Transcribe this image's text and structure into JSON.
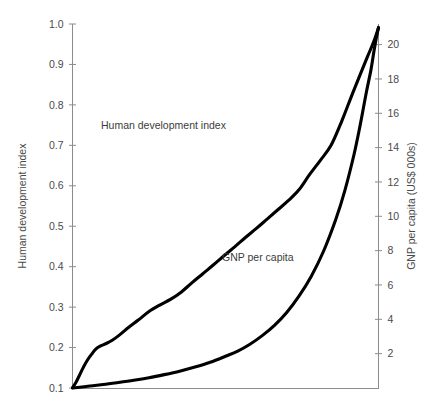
{
  "chart_data": {
    "type": "line",
    "title": "",
    "xlabel": "",
    "grid": false,
    "legend_position": "inline-annotations",
    "axes": {
      "left": {
        "label": "Human development index",
        "ticks": [
          "0.1",
          "0.2",
          "0.3",
          "0.4",
          "0.5",
          "0.6",
          "0.7",
          "0.8",
          "0.9",
          "1.0"
        ],
        "tick_values": [
          0.1,
          0.2,
          0.3,
          0.4,
          0.5,
          0.6,
          0.7,
          0.8,
          0.9,
          1.0
        ],
        "ylim": [
          0.1,
          1.0
        ]
      },
      "right": {
        "label": "GNP per capita (US$ 000s)",
        "ticks": [
          "2",
          "4",
          "6",
          "8",
          "10",
          "12",
          "14",
          "16",
          "18",
          "20"
        ],
        "tick_values": [
          2,
          4,
          6,
          8,
          10,
          12,
          14,
          16,
          18,
          20
        ],
        "ylim": [
          0,
          21.2
        ]
      },
      "x": {
        "label": "",
        "ticks": [],
        "xlim": [
          0,
          100
        ]
      }
    },
    "series": [
      {
        "name": "Human development index",
        "annotation": "Human development index",
        "axis": "left",
        "color": "#000000",
        "x": [
          0,
          1.2,
          2.5,
          3.6,
          4.8,
          6.2,
          7.6,
          9.2,
          11.0,
          13.0,
          15.5,
          18.5,
          21.5,
          25.0,
          28.5,
          32.0,
          35.5,
          39.0,
          42.5,
          46.0,
          49.5,
          53.0,
          56.5,
          60.0,
          63.5,
          67.0,
          70.5,
          74.0,
          77.5,
          81.0,
          84.5,
          88.0,
          91.5,
          94.5,
          96.5,
          98.0,
          99.0,
          100
        ],
        "y": [
          0.101,
          0.115,
          0.135,
          0.152,
          0.168,
          0.183,
          0.196,
          0.204,
          0.21,
          0.218,
          0.232,
          0.251,
          0.268,
          0.289,
          0.305,
          0.319,
          0.337,
          0.36,
          0.382,
          0.404,
          0.427,
          0.449,
          0.472,
          0.494,
          0.517,
          0.54,
          0.563,
          0.59,
          0.628,
          0.663,
          0.7,
          0.76,
          0.828,
          0.884,
          0.921,
          0.948,
          0.968,
          0.99
        ]
      },
      {
        "name": "GNP per capita",
        "annotation": "GNP per capita",
        "axis": "right",
        "color": "#000000",
        "x": [
          0,
          5,
          10,
          15,
          20,
          25,
          30,
          35,
          40,
          45,
          50,
          54,
          58,
          62,
          66,
          70,
          74,
          78,
          82,
          86,
          89,
          92,
          94,
          96,
          97.5,
          98.5,
          99.3,
          100
        ],
        "y": [
          0.0,
          0.1,
          0.2,
          0.32,
          0.45,
          0.6,
          0.78,
          0.98,
          1.22,
          1.5,
          1.85,
          2.15,
          2.55,
          3.05,
          3.65,
          4.4,
          5.35,
          6.5,
          7.95,
          9.8,
          11.5,
          13.6,
          15.3,
          17.2,
          18.5,
          19.6,
          20.4,
          21.0
        ]
      }
    ]
  },
  "annotations": {
    "hdi_label": "Human development index",
    "gnp_label": "GNP per capita"
  },
  "axis_titles": {
    "left": "Human development index",
    "right": "GNP per capita (US$ 000s)"
  },
  "colors": {
    "curve": "#000000",
    "axis": "#8c8c8c",
    "text": "#4a4a4a",
    "background": "#ffffff"
  }
}
